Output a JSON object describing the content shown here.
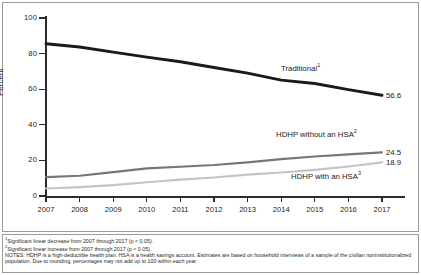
{
  "chart_data": {
    "type": "line",
    "title": "",
    "xlabel": "",
    "ylabel": "Percent",
    "ylim": [
      0,
      100
    ],
    "yticks": [
      0,
      20,
      40,
      60,
      80,
      100
    ],
    "grid": false,
    "legend_position": "inline-right",
    "categories": [
      "2007",
      "2008",
      "2009",
      "2010",
      "2011",
      "2012",
      "2013",
      "2014",
      "2015",
      "2016",
      "2017"
    ],
    "series": [
      {
        "name": "Traditional",
        "footnote_marker": "1",
        "color": "#1a1a1a",
        "values": [
          85.5,
          83.7,
          80.8,
          78.0,
          75.4,
          72.2,
          69.0,
          65.1,
          63.2,
          59.8,
          56.6
        ],
        "end_value_label": "56.6",
        "label_text": "Traditional"
      },
      {
        "name": "HDHP without an HSA",
        "footnote_marker": "2",
        "color": "#767676",
        "values": [
          10.6,
          11.4,
          13.4,
          15.5,
          16.4,
          17.4,
          18.9,
          20.7,
          22.2,
          23.4,
          24.5
        ],
        "end_value_label": "24.5",
        "label_text": "HDHP without an HSA"
      },
      {
        "name": "HDHP with an HSA",
        "footnote_marker": "3",
        "color": "#c4c4c4",
        "values": [
          4.2,
          5.0,
          6.1,
          7.7,
          9.2,
          10.4,
          12.0,
          13.2,
          14.7,
          16.6,
          18.9
        ],
        "end_value_label": "18.9",
        "label_text": "HDHP with an HSA"
      }
    ]
  },
  "axis": {
    "ylabel": "Percent",
    "ytick_labels": [
      "100",
      "80",
      "60",
      "40",
      "20",
      "0"
    ],
    "xtick_labels": [
      "2007",
      "2008",
      "2009",
      "2010",
      "2011",
      "2012",
      "2013",
      "2014",
      "2015",
      "2016",
      "2017"
    ]
  },
  "annotations": {
    "traditional_label": "Traditional",
    "traditional_sup": "1",
    "traditional_value": "56.6",
    "hdhp_without_label": "HDHP without an HSA",
    "hdhp_without_sup": "2",
    "hdhp_without_value": "24.5",
    "hdhp_with_label": "HDHP with an HSA",
    "hdhp_with_sup": "3",
    "hdhp_with_value": "18.9"
  },
  "notes": {
    "footnote1_sup": "1",
    "footnote1": "Significant linear decrease from 2007 through 2017 (p < 0.05).",
    "footnote2_sup": "2",
    "footnote2": "Significant linear increase from 2007 through 2017 (p < 0.05).",
    "notes_line": "NOTES: HDHP is a high-deductible health plan. HSA is a health savings account. Estimates are based on household interviews of a sample of the civilian noninstitutionalized population. Due to rounding, percentages may not add up to 100 within each year."
  }
}
